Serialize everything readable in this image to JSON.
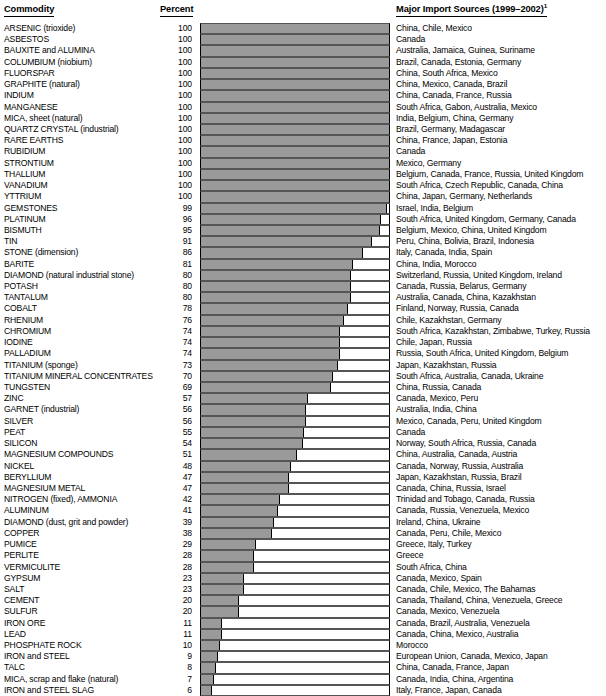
{
  "header": {
    "commodity_label": "Commodity",
    "percent_label": "Percent",
    "sources_label": "Major Import Sources (1999–2002)",
    "sources_footnote": "1"
  },
  "chart_data": {
    "type": "bar",
    "orientation": "horizontal",
    "title": "",
    "xlabel": "Percent",
    "ylabel": "Commodity",
    "xlim": [
      0,
      100
    ],
    "grid": false,
    "legend": "none",
    "bar_color": "#9a9a9a",
    "categories": [
      "ARSENIC (trioxide)",
      "ASBESTOS",
      "BAUXITE and ALUMINA",
      "COLUMBIUM (niobium)",
      "FLUORSPAR",
      "GRAPHITE (natural)",
      "INDIUM",
      "MANGANESE",
      "MICA, sheet (natural)",
      "QUARTZ CRYSTAL (industrial)",
      "RARE EARTHS",
      "RUBIDIUM",
      "STRONTIUM",
      "THALLIUM",
      "VANADIUM",
      "YTTRIUM",
      "GEMSTONES",
      "PLATINUM",
      "BISMUTH",
      "TIN",
      "STONE (dimension)",
      "BARITE",
      "DIAMOND (natural industrial stone)",
      "POTASH",
      "TANTALUM",
      "COBALT",
      "RHENIUM",
      "CHROMIUM",
      "IODINE",
      "PALLADIUM",
      "TITANIUM (sponge)",
      "TITANIUM MINERAL CONCENTRATES",
      "TUNGSTEN",
      "ZINC",
      "GARNET (industrial)",
      "SILVER",
      "PEAT",
      "SILICON",
      "MAGNESIUM COMPOUNDS",
      "NICKEL",
      "BERYLLIUM",
      "MAGNESIUM METAL",
      "NITROGEN (fixed), AMMONIA",
      "ALUMINUM",
      "DIAMOND (dust, grit and powder)",
      "COPPER",
      "PUMICE",
      "PERLITE",
      "VERMICULITE",
      "GYPSUM",
      "SALT",
      "CEMENT",
      "SULFUR",
      "IRON ORE",
      "LEAD",
      "PHOSPHATE ROCK",
      "IRON and STEEL",
      "TALC",
      "MICA, scrap and flake (natural)",
      "IRON and STEEL SLAG"
    ],
    "values": [
      100,
      100,
      100,
      100,
      100,
      100,
      100,
      100,
      100,
      100,
      100,
      100,
      100,
      100,
      100,
      100,
      99,
      96,
      95,
      91,
      86,
      81,
      80,
      80,
      80,
      78,
      76,
      74,
      74,
      74,
      73,
      70,
      69,
      57,
      56,
      56,
      55,
      54,
      51,
      48,
      47,
      47,
      42,
      41,
      39,
      38,
      29,
      28,
      28,
      23,
      23,
      20,
      20,
      11,
      11,
      10,
      9,
      8,
      7,
      6
    ],
    "annotations": [
      "China, Chile, Mexico",
      "Canada",
      "Australia, Jamaica, Guinea, Suriname",
      "Brazil, Canada, Estonia, Germany",
      "China, South Africa, Mexico",
      "China, Mexico, Canada, Brazil",
      "China, Canada, France, Russia",
      "South Africa, Gabon, Australia, Mexico",
      "India, Belgium, China, Germany",
      "Brazil, Germany, Madagascar",
      "China, France, Japan, Estonia",
      "Canada",
      "Mexico, Germany",
      "Belgium, Canada, France, Russia, United Kingdom",
      "South Africa, Czech Republic, Canada, China",
      "China, Japan, Germany, Netherlands",
      "Israel, India, Belgium",
      "South Africa, United Kingdom, Germany, Canada",
      "Belgium, Mexico, China, United Kingdom",
      "Peru, China, Bolivia, Brazil, Indonesia",
      "Italy, Canada, India, Spain",
      "China, India, Morocco",
      "Switzerland, Russia, United Kingdom, Ireland",
      "Canada, Russia, Belarus, Germany",
      "Australia, Canada, China, Kazakhstan",
      "Finland, Norway, Russia, Canada",
      "Chile, Kazakhstan, Germany",
      "South Africa, Kazakhstan, Zimbabwe, Turkey, Russia",
      "Chile, Japan, Russia",
      "Russia, South Africa, United Kingdom, Belgium",
      "Japan, Kazakhstan, Russia",
      "South Africa, Australia, Canada, Ukraine",
      "China, Russia, Canada",
      "Canada, Mexico, Peru",
      "Australia, India, China",
      "Mexico, Canada, Peru, United Kingdom",
      "Canada",
      "Norway, South Africa, Russia, Canada",
      "China, Australia, Canada, Austria",
      "Canada, Norway, Russia, Australia",
      "Japan, Kazakhstan, Russia, Brazil",
      "Canada, China, Russia, Israel",
      "Trinidad and Tobago, Canada, Russia",
      "Canada, Russia, Venezuela, Mexico",
      "Ireland, China, Ukraine",
      "Canada, Peru, Chile, Mexico",
      "Greece, Italy, Turkey",
      "Greece",
      "South Africa, China",
      "Canada, Mexico, Spain",
      "Canada, Chile, Mexico, The Bahamas",
      "Canada, Thailand, China, Venezuela, Greece",
      "Canada, Mexico, Venezuela",
      "Canada, Brazil, Australia, Venezuela",
      "Canada, China, Mexico, Australia",
      "Morocco",
      "European Union, Canada, Mexico, Japan",
      "China, Canada, France, Japan",
      "Canada, India, China, Argentina",
      "Italy, France, Japan, Canada"
    ]
  }
}
